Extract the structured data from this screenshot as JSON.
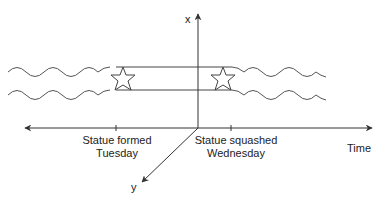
{
  "diagram": {
    "axes": {
      "x_label": "x",
      "y_label": "y",
      "time_label": "Time"
    },
    "events": [
      {
        "line1": "Statue formed",
        "line2": "Tuesday",
        "tick_x": 116
      },
      {
        "line1": "Statue squashed",
        "line2": "Wednesday",
        "tick_x": 231
      }
    ],
    "worldlines": {
      "upper_y": 67,
      "lower_y": 90,
      "star_left_center": [
        123,
        79
      ],
      "star_right_center": [
        223,
        79
      ]
    },
    "colors": {
      "line": "#333333",
      "wave": "#555555"
    }
  }
}
